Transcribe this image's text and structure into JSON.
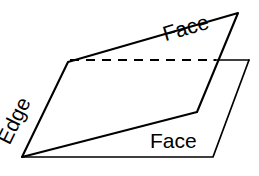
{
  "figure": {
    "kind": "geometry-diagram",
    "background_color": "#ffffff",
    "line_color": "#000000"
  },
  "labels": {
    "face_top": "Face",
    "face_bottom": "Face",
    "edge": "Edge"
  },
  "shapes": {
    "tilted_plane": {
      "name": "tilted-face-plane",
      "points": "68,62 238,13 197,112 22,157",
      "closed": true,
      "style": "solid"
    },
    "horizontal_plane_visible": {
      "name": "horizontal-face-plane",
      "points": "248,60 213,157 22,157",
      "closed": false,
      "style": "solid"
    },
    "horizontal_plane_hidden_edge": {
      "name": "hidden-back-edge",
      "points": "70,60 218,60",
      "closed": false,
      "style": "dashed"
    },
    "horizontal_plane_visible_back_edge": {
      "name": "visible-back-edge-segment",
      "points": "218,60 248,60",
      "closed": false,
      "style": "solid"
    }
  }
}
